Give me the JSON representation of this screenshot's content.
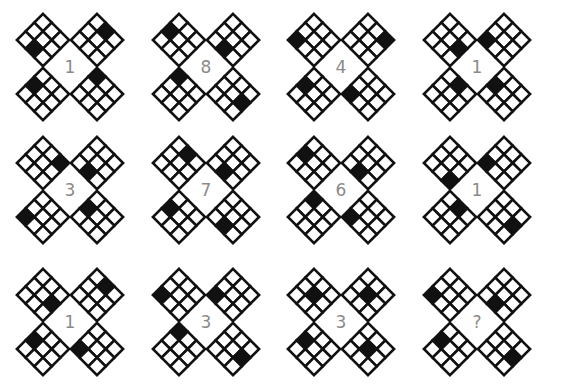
{
  "puzzle": {
    "grid_size": 3,
    "colors": {
      "shaded": "#111111",
      "empty": "#ffffff",
      "line": "#111111",
      "label": "#8a8a8a",
      "background": "#ffffff"
    },
    "cell_coordinate_note": "Each diamond is a 3x3 grid rotated 45deg; [row,col] with [0,0]=top vertex, [2,0]=left vertex, [0,2]=right vertex, [2,2]=bottom vertex",
    "figures": [
      {
        "label": "1",
        "cx": 70,
        "cy": 67,
        "diamonds": {
          "tl": [
            2,
            1
          ],
          "tr": [
            0,
            1
          ],
          "bl": [
            1,
            0
          ],
          "br": [
            0,
            0
          ]
        }
      },
      {
        "label": "8",
        "cx": 206,
        "cy": 67,
        "diamonds": {
          "tl": [
            1,
            0
          ],
          "tr": [
            2,
            1
          ],
          "bl": [
            0,
            0
          ],
          "br": [
            1,
            2
          ]
        }
      },
      {
        "label": "4",
        "cx": 341,
        "cy": 67,
        "diamonds": {
          "tl": [
            2,
            0
          ],
          "tr": [
            0,
            2
          ],
          "bl": [
            1,
            0
          ],
          "br": [
            2,
            0
          ]
        }
      },
      {
        "label": "1",
        "cx": 477,
        "cy": 67,
        "diamonds": {
          "tl": [
            1,
            2
          ],
          "tr": [
            2,
            0
          ],
          "bl": [
            0,
            1
          ],
          "br": [
            1,
            0
          ]
        }
      },
      {
        "label": "3",
        "cx": 70,
        "cy": 190,
        "diamonds": {
          "tl": [
            0,
            2
          ],
          "tr": [
            2,
            1
          ],
          "bl": [
            2,
            0
          ],
          "br": [
            1,
            0
          ]
        }
      },
      {
        "label": "7",
        "cx": 206,
        "cy": 190,
        "diamonds": {
          "tl": [
            0,
            1
          ],
          "tr": [
            2,
            1
          ],
          "bl": [
            1,
            0
          ],
          "br": [
            2,
            1
          ]
        }
      },
      {
        "label": "6",
        "cx": 341,
        "cy": 190,
        "diamonds": {
          "tl": [
            1,
            0
          ],
          "tr": [
            2,
            1
          ],
          "bl": [
            0,
            0
          ],
          "br": [
            2,
            0
          ]
        }
      },
      {
        "label": "1",
        "cx": 477,
        "cy": 190,
        "diamonds": {
          "tl": [
            2,
            2
          ],
          "tr": [
            2,
            0
          ],
          "bl": [
            0,
            1
          ],
          "br": [
            1,
            2
          ]
        }
      },
      {
        "label": "1",
        "cx": 70,
        "cy": 322,
        "diamonds": {
          "tl": [
            1,
            2
          ],
          "tr": [
            0,
            1
          ],
          "bl": [
            1,
            0
          ],
          "br": [
            2,
            0
          ]
        }
      },
      {
        "label": "3",
        "cx": 206,
        "cy": 322,
        "diamonds": {
          "tl": [
            2,
            0
          ],
          "tr": [
            2,
            0
          ],
          "bl": [
            0,
            0
          ],
          "br": [
            1,
            2
          ]
        }
      },
      {
        "label": "3",
        "cx": 341,
        "cy": 322,
        "diamonds": {
          "tl": [
            1,
            1
          ],
          "tr": [
            1,
            1
          ],
          "bl": [
            1,
            0
          ],
          "br": [
            1,
            1
          ]
        }
      },
      {
        "label": "?",
        "cx": 477,
        "cy": 322,
        "diamonds": {
          "tl": [
            2,
            0
          ],
          "tr": [
            2,
            1
          ],
          "bl": [
            1,
            0
          ],
          "br": [
            1,
            2
          ]
        }
      }
    ]
  }
}
